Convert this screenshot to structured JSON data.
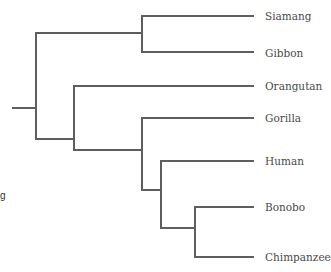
{
  "diagram": {
    "type": "phylogenetic-tree",
    "line_color": "#5e5e5e",
    "text_color": "#4a4a4a",
    "leaves": [
      {
        "label": "Siamang",
        "y": 16
      },
      {
        "label": "Gibbon",
        "y": 53
      },
      {
        "label": "Orangutan",
        "y": 86
      },
      {
        "label": "Gorilla",
        "y": 118
      },
      {
        "label": "Human",
        "y": 161
      },
      {
        "label": "Bonobo",
        "y": 207
      },
      {
        "label": "Chimpanzee",
        "y": 257
      }
    ],
    "side_fragment": "g"
  }
}
